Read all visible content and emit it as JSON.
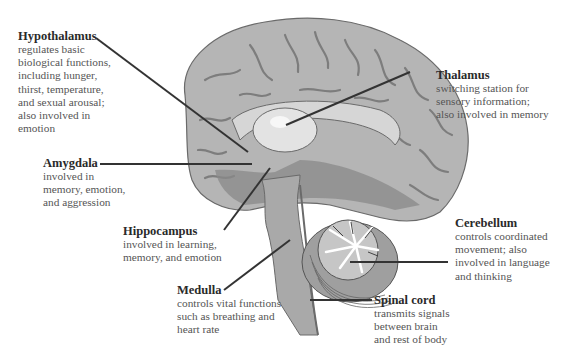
{
  "diagram": {
    "colors": {
      "cortex": "#b5b5b5",
      "cortex_fold": "#7d7d7d",
      "limbic": "#d6d6d6",
      "thalamus": "#e3e3e3",
      "brainstem": "#a9a9a9",
      "dark_region": "#8a8a8a",
      "leader_line": "#333333",
      "title_text": "#2a2a2a",
      "desc_text": "#555555"
    },
    "labels": [
      {
        "id": "hypothalamus",
        "title": "Hypothalamus",
        "description": "regulates basic\nbiological functions,\nincluding hunger,\nthirst, temperature,\nand sexual arousal;\nalso involved in\nemotion"
      },
      {
        "id": "thalamus",
        "title": "Thalamus",
        "description": "switching station for\nsensory information;\nalso involved in memory"
      },
      {
        "id": "amygdala",
        "title": "Amygdala",
        "description": "involved in\nmemory, emotion,\nand aggression"
      },
      {
        "id": "hippocampus",
        "title": "Hippocampus",
        "description": "involved in learning,\nmemory, and emotion"
      },
      {
        "id": "cerebellum",
        "title": "Cerebellum",
        "description": "controls coordinated\nmovement; also\ninvolved in language\nand thinking"
      },
      {
        "id": "medulla",
        "title": "Medulla",
        "description": "controls vital functions\nsuch as breathing and\nheart rate"
      },
      {
        "id": "spinal_cord",
        "title": "Spinal cord",
        "description": "transmits signals\nbetween brain\nand rest of body"
      }
    ]
  }
}
